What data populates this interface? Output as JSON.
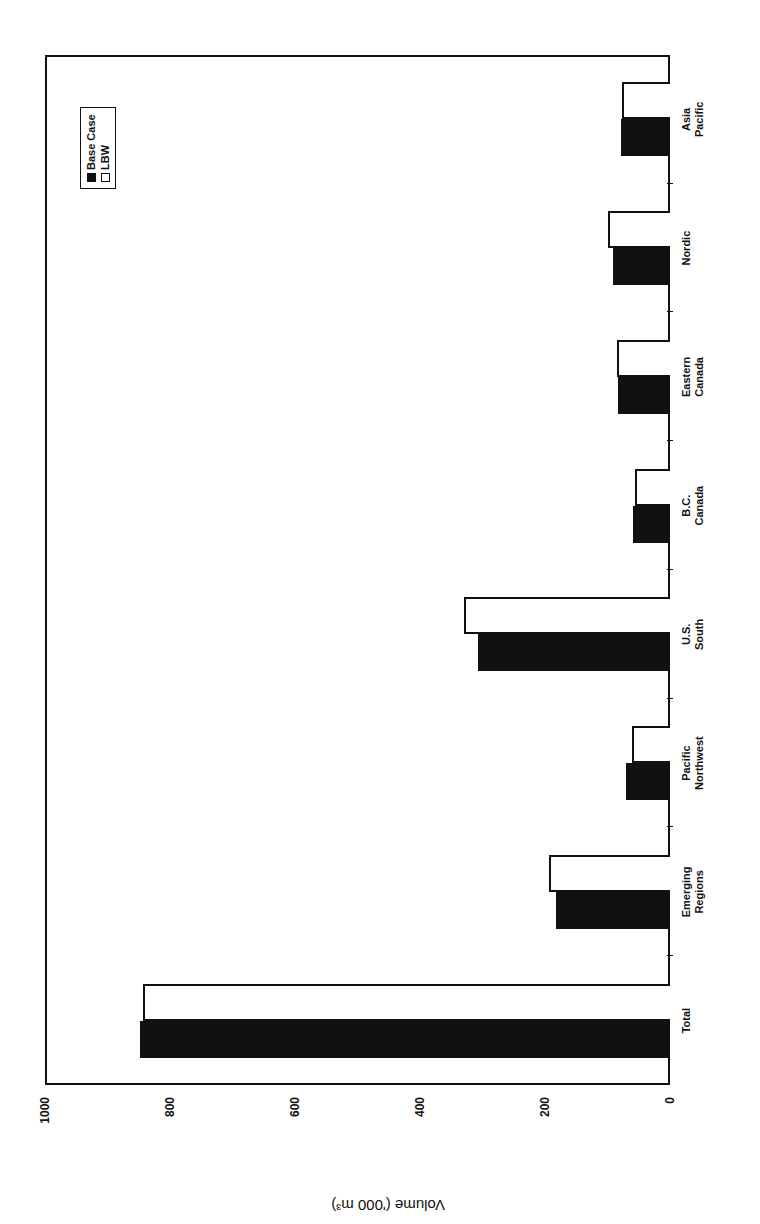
{
  "chart_data": {
    "type": "bar",
    "orientation_note_rotated": "figure is rotated 90 degrees on the page",
    "title": "",
    "xlabel": "",
    "ylabel": "Volume ('000 m³)",
    "ylim": [
      0,
      1000
    ],
    "yticks": [
      "0",
      "200",
      "400",
      "600",
      "800",
      "1000"
    ],
    "categories": [
      "Total",
      "Emerging Regions",
      "Pacific Northwest",
      "U.S. South",
      "B.C. Canada",
      "Eastern Canada",
      "Nordic",
      "Asia Pacific"
    ],
    "category_lines": [
      [
        "Total"
      ],
      [
        "Emerging",
        "Regions"
      ],
      [
        "Pacific",
        "Northwest"
      ],
      [
        "U.S.",
        "South"
      ],
      [
        "B.C.",
        "Canada"
      ],
      [
        "Eastern",
        "Canada"
      ],
      [
        "Nordic"
      ],
      [
        "Asia",
        "Pacific"
      ]
    ],
    "series": [
      {
        "name": "Base Case",
        "color": "#111111",
        "values": [
          848,
          183,
          71,
          308,
          59,
          83,
          91,
          79
        ]
      },
      {
        "name": "LBW",
        "color": "#ffffff",
        "values": [
          843,
          194,
          61,
          329,
          56,
          85,
          100,
          77
        ]
      }
    ],
    "legend": {
      "position": "upper-right",
      "entries": [
        "Base Case",
        "LBW"
      ]
    },
    "grid": false
  }
}
